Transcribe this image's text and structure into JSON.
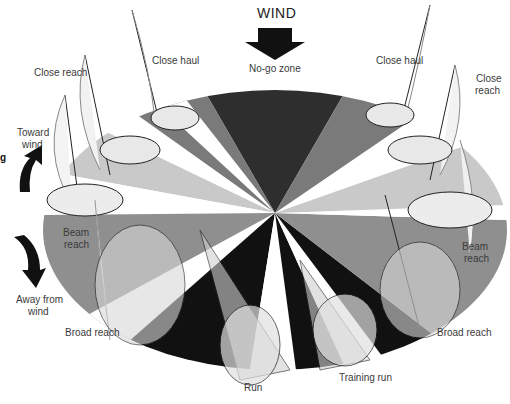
{
  "title": "WIND",
  "colors": {
    "no_go": "#2e2e2e",
    "close": "#6d6d6d",
    "light_gray": "#c9c9c9",
    "beam": "#8f8f8f",
    "run_black": "#111111",
    "white": "#ffffff",
    "arrow": "#111111"
  },
  "labels": {
    "wind": "WIND",
    "no_go": "No-go zone",
    "close_haul_left": "Close haul",
    "close_haul_right": "Close haul",
    "close_reach_left": "Close reach",
    "close_reach_right_1": "Close",
    "close_reach_right_2": "reach",
    "toward_wind_1": "Toward",
    "toward_wind_2": "wind",
    "beam_reach_left_1": "Beam",
    "beam_reach_left_2": "reach",
    "beam_reach_right_1": "Beam",
    "beam_reach_right_2": "reach",
    "away_from_wind_1": "Away from",
    "away_from_wind_2": "wind",
    "broad_reach_left": "Broad reach",
    "broad_reach_right": "Broad reach",
    "run": "Run",
    "training_run": "Training run",
    "cut_edge_char": "g"
  },
  "icons": {
    "wind_arrow": "down-arrow-icon",
    "toward_wind_arrow": "curved-up-arrow-icon",
    "away_wind_arrow": "curved-down-arrow-icon",
    "boats": "sailboat-icon"
  }
}
